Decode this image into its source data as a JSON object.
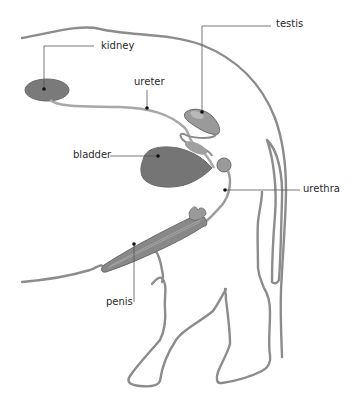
{
  "diagram": {
    "colors": {
      "outline": "#8c8c8c",
      "organ_fill": "#7a7a7a",
      "organ_light": "#a8a8a8",
      "leader_line": "#555555",
      "label_text": "#2a2a2a",
      "background": "#ffffff"
    },
    "labels": [
      {
        "id": "kidney",
        "text": "kidney"
      },
      {
        "id": "ureter",
        "text": "ureter"
      },
      {
        "id": "testis",
        "text": "testis"
      },
      {
        "id": "bladder",
        "text": "bladder"
      },
      {
        "id": "urethra",
        "text": "urethra"
      },
      {
        "id": "penis",
        "text": "penis"
      }
    ]
  }
}
